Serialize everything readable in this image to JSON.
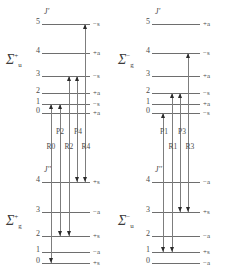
{
  "figure": {
    "line_color": "#6e6e6e",
    "arrow_color": "#2b2b2b",
    "background": "#ffffff"
  },
  "panels": {
    "upper_left": {
      "term_symbol": "Σ",
      "term_superscript": "+",
      "term_subscript": "u",
      "j_heading": "J'",
      "levels": [
        {
          "j": "5",
          "parity": "−s"
        },
        {
          "j": "4",
          "parity": "+a"
        },
        {
          "j": "3",
          "parity": "−s"
        },
        {
          "j": "2",
          "parity": "+a"
        },
        {
          "j": "1",
          "parity": "−s"
        },
        {
          "j": "0",
          "parity": "+a"
        }
      ]
    },
    "upper_right": {
      "term_symbol": "Σ",
      "term_superscript": "−",
      "term_subscript": "g",
      "j_heading": "J'",
      "levels": [
        {
          "j": "5",
          "parity": "+a"
        },
        {
          "j": "4",
          "parity": "−s"
        },
        {
          "j": "3",
          "parity": "+a"
        },
        {
          "j": "2",
          "parity": "−s"
        },
        {
          "j": "1",
          "parity": "+a"
        },
        {
          "j": "0",
          "parity": "−s"
        }
      ]
    },
    "lower_left": {
      "term_symbol": "Σ",
      "term_superscript": "+",
      "term_subscript": "g",
      "j_heading": "J''",
      "levels": [
        {
          "j": "4",
          "parity": "+s"
        },
        {
          "j": "3",
          "parity": "−a"
        },
        {
          "j": "2",
          "parity": "+s"
        },
        {
          "j": "1",
          "parity": "−a"
        },
        {
          "j": "0",
          "parity": "+s"
        }
      ]
    },
    "lower_right": {
      "term_symbol": "Σ",
      "term_superscript": "−",
      "term_subscript": "u",
      "j_heading": "J''",
      "levels": [
        {
          "j": "4",
          "parity": "−a"
        },
        {
          "j": "3",
          "parity": "+s"
        },
        {
          "j": "2",
          "parity": "−a"
        },
        {
          "j": "1",
          "parity": "+s"
        },
        {
          "j": "0",
          "parity": "−a"
        }
      ]
    }
  },
  "branch_labels": {
    "left": {
      "p": [
        "P2",
        "P4"
      ],
      "r": [
        "R0",
        "R2",
        "R4"
      ]
    },
    "right": {
      "p": [
        "P1",
        "P3"
      ],
      "r": [
        "R1",
        "R3"
      ]
    }
  }
}
